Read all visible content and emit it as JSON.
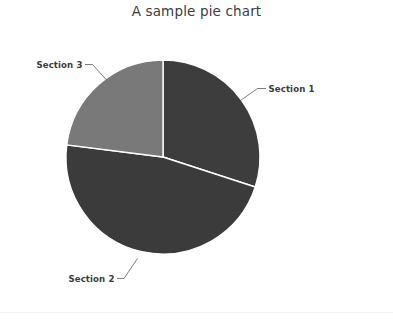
{
  "chart_data": {
    "type": "pie",
    "title": "A sample pie chart",
    "xlabel": "",
    "ylabel": "",
    "legend_position": "none",
    "grid": false,
    "labels": [
      "Section 1",
      "Section 2",
      "Section 3"
    ],
    "values": [
      30,
      47,
      23
    ],
    "units": "percent",
    "start_angle_deg": 90,
    "direction": "clockwise",
    "slice_angles_deg": [
      108,
      170,
      82
    ],
    "colors": [
      "#3d3d3d",
      "#3b3b3b",
      "#797979"
    ],
    "slices": [
      {
        "label": "Section 1",
        "value": 30,
        "angle_deg": 108,
        "color": "#3d3d3d",
        "label_anchor": "start"
      },
      {
        "label": "Section 2",
        "value": 47,
        "angle_deg": 170,
        "color": "#3b3b3b",
        "label_anchor": "end"
      },
      {
        "label": "Section 3",
        "value": 23,
        "angle_deg": 82,
        "color": "#797979",
        "label_anchor": "end"
      }
    ]
  },
  "figure": {
    "background_color": "#ffffff",
    "separator_color": "#f2f2f2",
    "leader_line_color": "#6e6e6e",
    "text_color": "#3c3c3c"
  },
  "labels": {
    "section1": "Section 1",
    "section2": "Section 2",
    "section3": "Section 3"
  }
}
